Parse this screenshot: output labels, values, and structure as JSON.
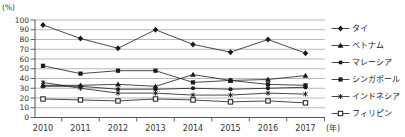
{
  "chart_data": {
    "type": "line",
    "title": "",
    "xlabel": "(年)",
    "ylabel": "(%)",
    "x": [
      "2010",
      "2011",
      "2012",
      "2013",
      "2014",
      "2015",
      "2016",
      "2017"
    ],
    "ylim": [
      0,
      100
    ],
    "ytick_step": 10,
    "grid": true,
    "legend_position": "right",
    "series": [
      {
        "id": "thailand",
        "name": "タイ",
        "marker": "diamond",
        "values": [
          95,
          81,
          71,
          90,
          75,
          67,
          80,
          66
        ]
      },
      {
        "id": "vietnam",
        "name": "ベトナム",
        "marker": "triangle",
        "values": [
          33,
          33,
          34,
          32,
          44,
          38,
          39,
          43
        ]
      },
      {
        "id": "malaysia",
        "name": "マレーシア",
        "marker": "circle",
        "values": [
          32,
          32,
          29,
          29,
          30,
          29,
          30,
          31
        ]
      },
      {
        "id": "singapore",
        "name": "シンガポール",
        "marker": "square",
        "values": [
          53,
          45,
          48,
          48,
          36,
          38,
          34,
          33
        ]
      },
      {
        "id": "indonesia",
        "name": "インドネシア",
        "marker": "asterisk",
        "values": [
          36,
          30,
          25,
          25,
          23,
          23,
          25,
          24
        ]
      },
      {
        "id": "philippines",
        "name": "フィリピン",
        "marker": "open-square",
        "values": [
          19,
          18,
          17,
          19,
          18,
          16,
          17,
          15
        ]
      }
    ],
    "colors": {
      "line": "#1a1a1a",
      "grid": "#999999",
      "axis": "#555555",
      "text": "#333333",
      "background": "#ffffff"
    }
  }
}
